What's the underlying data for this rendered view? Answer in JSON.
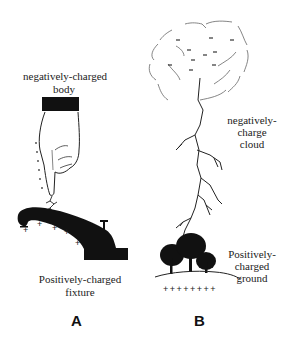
{
  "panels": [
    {
      "letter": "A",
      "top_label_line1": "negatively-charged",
      "top_label_line2": "body",
      "bottom_label_line1": "Positively-charged",
      "bottom_label_line2": "fixture",
      "charge_symbols": [
        "+",
        "+",
        "+",
        "+",
        "+"
      ]
    },
    {
      "letter": "B",
      "cloud_label_line1": "negatively-",
      "cloud_label_line2": "charge",
      "cloud_label_line3": "cloud",
      "ground_label_line1": "Positively-",
      "ground_label_line2": "charged",
      "ground_label_line3": "ground",
      "ground_charges": "+ + + + + + + +",
      "cloud_charges": [
        "-",
        "-",
        "-",
        "-",
        "-",
        "-",
        "-",
        "-",
        "-",
        "-"
      ]
    }
  ],
  "colors": {
    "ink": "#111111",
    "background": "#ffffff"
  }
}
